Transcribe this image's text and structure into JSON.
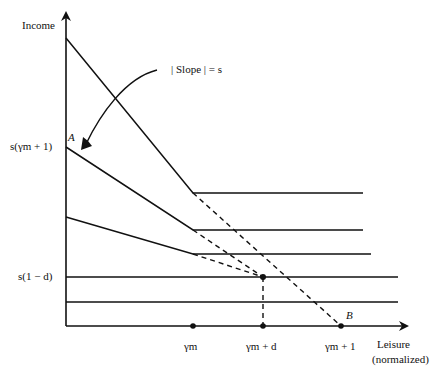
{
  "diagram": {
    "y_axis_label": "Income",
    "x_axis_label_line1": "Leisure",
    "x_axis_label_line2": "(normalized)",
    "annotation": "| Slope | = s",
    "point_labels": {
      "A": "A",
      "B": "B"
    },
    "y_ticks": [
      {
        "label": "s(γm + 1)"
      },
      {
        "label": "s(1 − d)"
      }
    ],
    "x_ticks": [
      {
        "label": "γm"
      },
      {
        "label": "γm + d"
      },
      {
        "label": "γm + 1"
      }
    ],
    "colors": {
      "line": "#111111",
      "background": "#ffffff"
    }
  }
}
